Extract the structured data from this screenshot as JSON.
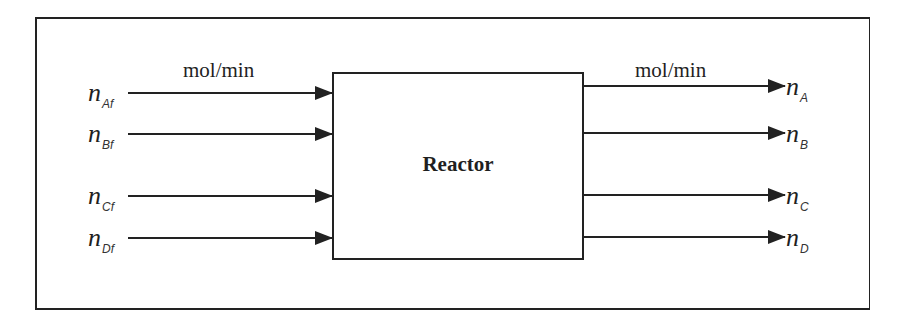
{
  "diagram": {
    "type": "flow-block-diagram",
    "block": {
      "label": "Reactor"
    },
    "units": {
      "inlet": "mol/min",
      "outlet": "mol/min"
    },
    "inlets": [
      {
        "symbol": "n",
        "subscript": "Af",
        "label": "n_Af"
      },
      {
        "symbol": "n",
        "subscript": "Bf",
        "label": "n_Bf"
      },
      {
        "symbol": "n",
        "subscript": "Cf",
        "label": "n_Cf"
      },
      {
        "symbol": "n",
        "subscript": "Df",
        "label": "n_Df"
      }
    ],
    "outlets": [
      {
        "symbol": "n",
        "subscript": "A",
        "label": "n_A"
      },
      {
        "symbol": "n",
        "subscript": "B",
        "label": "n_B"
      },
      {
        "symbol": "n",
        "subscript": "C",
        "label": "n_C"
      },
      {
        "symbol": "n",
        "subscript": "D",
        "label": "n_D"
      }
    ],
    "colors": {
      "line": "#222222",
      "background": "#ffffff"
    }
  }
}
